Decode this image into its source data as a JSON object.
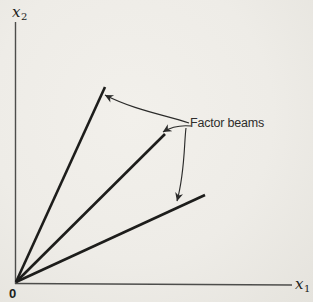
{
  "figure": {
    "type": "diagram",
    "background_color": "#eeece7",
    "ink_color": "#1d1d1b",
    "axis_color": "#4d4d4b",
    "labels": {
      "y_axis_base": "x",
      "y_axis_sub": "2",
      "x_axis_base": "x",
      "x_axis_sub": "1",
      "origin": "0",
      "annotation": "Factor beams"
    },
    "paths": {
      "y_axis": "M 15.5,22 L 15.5,284",
      "x_axis": "M 15,283.5 L 292,285",
      "beam_upper": "M 16,282 L 105,87",
      "beam_middle": "M 16,282 L 165,134",
      "beam_lower": "M 16,282 L 205,195",
      "arrow_upper": "M 189,123 C 165,115 134,110 105,95",
      "arrow_middle": "M 191,126 C 181,125 171,127 163,132",
      "arrow_lower": "M 186,128 C 184,143 185,172 177,201"
    }
  }
}
